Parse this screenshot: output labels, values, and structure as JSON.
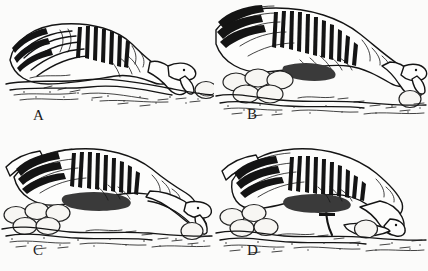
{
  "figure": {
    "kind": "scientific-line-drawing",
    "background_color": "#fbfbfa",
    "ink_color": "#141414",
    "panel_count": 4
  },
  "panels": [
    {
      "id": "A",
      "label": "A",
      "description": "Goose crouched low on nest, neck extended forward and bill reaching toward a single egg lying outside the nest on the right",
      "egg_outside_count": 1,
      "egg_nest_count": 0,
      "bird_orientation": "facing-right",
      "bill_contact": "approaching"
    },
    {
      "id": "B",
      "label": "B",
      "description": "Goose leaning far forward over the nest rim, bill touching the displaced egg at right; clutch of eggs visible at left inside the nest",
      "egg_outside_count": 1,
      "egg_nest_count": 5,
      "bird_orientation": "facing-right",
      "bill_contact": "touching"
    },
    {
      "id": "C",
      "label": "C",
      "description": "Goose with head lowered and neck stretched out, underside of bill placed against the far side of the displaced egg; clutch at left",
      "egg_outside_count": 1,
      "egg_nest_count": 5,
      "bird_orientation": "facing-right",
      "bill_contact": "behind-egg"
    },
    {
      "id": "D",
      "label": "D",
      "description": "Goose drawing the egg back toward the nest, egg tucked beneath the underside of the bill and neck; clutch at left",
      "egg_outside_count": 1,
      "egg_nest_count": 4,
      "bird_orientation": "facing-right",
      "bill_contact": "rolling-back"
    }
  ]
}
